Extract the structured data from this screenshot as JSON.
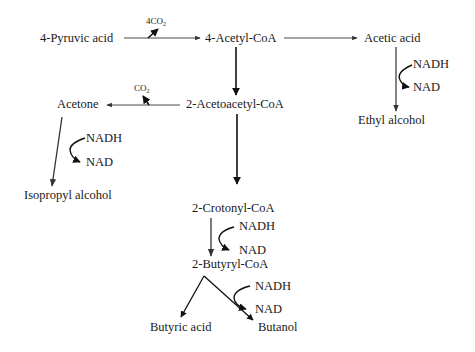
{
  "diagram": {
    "type": "metabolic-pathway",
    "nodes": {
      "pyruvic_acid": "4-Pyruvic acid",
      "acetyl_coa": "4-Acetyl-CoA",
      "acetic_acid": "Acetic acid",
      "ethyl_alcohol": "Ethyl alcohol",
      "acetoacetyl_coa": "2-Acetoacetyl-CoA",
      "acetone": "Acetone",
      "isopropyl_alcohol": "Isopropyl alcohol",
      "crotonyl_coa": "2-Crotonyl-CoA",
      "butyryl_coa": "2-Butyryl-CoA",
      "butyric_acid": "Butyric acid",
      "butanol": "Butanol"
    },
    "byproducts": {
      "co2_pyruvate_main": "4CO",
      "co2_pyruvate_sub": "2",
      "co2_acetone_main": "CO",
      "co2_acetone_sub": "2"
    },
    "cofactors": {
      "acetic_to_ethyl": {
        "in": "NADH",
        "out": "NAD"
      },
      "acetone_to_isopropyl": {
        "in": "NADH",
        "out": "NAD"
      },
      "crotonyl_to_butyryl": {
        "in": "NADH",
        "out": "NAD"
      },
      "butyryl_to_butanol": {
        "in": "NADH",
        "out": "NAD"
      }
    },
    "edges": [
      {
        "from": "4-Pyruvic acid",
        "to": "4-Acetyl-CoA",
        "releases": "4CO2"
      },
      {
        "from": "4-Acetyl-CoA",
        "to": "Acetic acid"
      },
      {
        "from": "Acetic acid",
        "to": "Ethyl alcohol",
        "cofactor": "NADH -> NAD"
      },
      {
        "from": "4-Acetyl-CoA",
        "to": "2-Acetoacetyl-CoA"
      },
      {
        "from": "2-Acetoacetyl-CoA",
        "to": "Acetone",
        "releases": "CO2"
      },
      {
        "from": "Acetone",
        "to": "Isopropyl alcohol",
        "cofactor": "NADH -> NAD"
      },
      {
        "from": "2-Acetoacetyl-CoA",
        "to": "2-Crotonyl-CoA"
      },
      {
        "from": "2-Crotonyl-CoA",
        "to": "2-Butyryl-CoA",
        "cofactor": "NADH -> NAD"
      },
      {
        "from": "2-Butyryl-CoA",
        "to": "Butyric acid"
      },
      {
        "from": "2-Butyryl-CoA",
        "to": "Butanol",
        "cofactor": "NADH -> NAD"
      }
    ]
  }
}
